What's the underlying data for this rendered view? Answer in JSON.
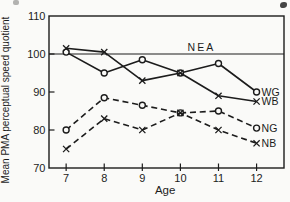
{
  "figure": {
    "background": "#fafaf8",
    "ink": "#1c1c1c"
  },
  "chart_data": {
    "type": "line",
    "title": "",
    "xlabel": "Age",
    "ylabel": "Mean PMA perceptual speed quotient",
    "x": [
      7,
      8,
      9,
      10,
      11,
      12
    ],
    "xticks": [
      7,
      8,
      9,
      10,
      11,
      12
    ],
    "yticks": [
      70,
      80,
      90,
      100,
      110
    ],
    "xlim": [
      6.55,
      12.72
    ],
    "ylim": [
      70,
      110
    ],
    "grid": false,
    "legend_position": "right-of-last-point",
    "reference_line": {
      "value": 100,
      "label": "NEA"
    },
    "series": [
      {
        "name": "WG",
        "line": "solid",
        "marker": "circle",
        "values": [
          100.5,
          95,
          98.5,
          95,
          97.5,
          90
        ]
      },
      {
        "name": "WB",
        "line": "solid",
        "marker": "x",
        "values": [
          101.5,
          100.5,
          93,
          95,
          89,
          87.5
        ]
      },
      {
        "name": "NG",
        "line": "dashed",
        "marker": "circle",
        "values": [
          80,
          88.5,
          86.5,
          84.5,
          85,
          80.5
        ]
      },
      {
        "name": "NB",
        "line": "dashed",
        "marker": "x",
        "values": [
          75,
          83,
          80,
          84.5,
          80,
          76.5
        ]
      }
    ]
  }
}
